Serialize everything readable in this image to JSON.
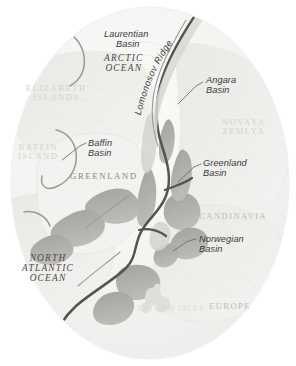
{
  "map": {
    "title": "Arctic Ocean and North Atlantic bathymetric basins map",
    "projection_shape": "oval",
    "colors": {
      "background": "#ffffff",
      "ocean_fill": "#f4f4f2",
      "shelf_fill": "#ededea",
      "ridge_dark": "#55554f",
      "ridge_mid": "#a9a8a3",
      "ridge_light": "#c8c7c2",
      "leader_line": "#6a6a66",
      "land_label_dark": "#8d8778",
      "land_label_faint": "#d3d2cf"
    },
    "features": [
      {
        "id": "laurentian-basin",
        "name": "Laurentian",
        "name_line2": "Basin",
        "type": "basin",
        "style": "feature",
        "x": 104,
        "y": 30,
        "leader": false
      },
      {
        "id": "arctic-ocean",
        "name": "ARCTIC",
        "name_line2": "OCEAN",
        "type": "ocean",
        "style": "ocean",
        "x": 113,
        "y": 55,
        "leader": false
      },
      {
        "id": "lomonosov-ridge",
        "name": "Lomonosov Ridge",
        "name_line2": "",
        "type": "ridge",
        "style": "feature-curved",
        "x": 151,
        "y": 40,
        "leader": false
      },
      {
        "id": "angara-basin",
        "name": "Angara",
        "name_line2": "Basin",
        "type": "basin",
        "style": "feature",
        "x": 206,
        "y": 77,
        "leader": true
      },
      {
        "id": "elizabeth-islands",
        "name": "ELIZABETH",
        "name_line2": "ISLANDS",
        "type": "land",
        "style": "land-faint",
        "x": 34,
        "y": 85,
        "leader": false
      },
      {
        "id": "novaya-zemlya",
        "name": "NOVAYA",
        "name_line2": "ZEMLYA",
        "type": "land",
        "style": "land-faint",
        "x": 228,
        "y": 120,
        "leader": false
      },
      {
        "id": "baffin-island",
        "name": "BAFFIN",
        "name_line2": "ISLAND",
        "type": "land",
        "style": "land-faint",
        "x": 22,
        "y": 144,
        "leader": false
      },
      {
        "id": "baffin-basin",
        "name": "Baffin",
        "name_line2": "Basin",
        "type": "basin",
        "style": "feature",
        "x": 88,
        "y": 140,
        "leader": true
      },
      {
        "id": "greenland",
        "name": "GREENLAND",
        "name_line2": "",
        "type": "land",
        "style": "land-dark",
        "x": 73,
        "y": 173,
        "leader": false
      },
      {
        "id": "greenland-basin",
        "name": "Greenland",
        "name_line2": "Basin",
        "type": "basin",
        "style": "feature",
        "x": 203,
        "y": 160,
        "leader": true
      },
      {
        "id": "scandinavia",
        "name": "SCANDINAVIA",
        "name_line2": "",
        "type": "land",
        "style": "land-mid",
        "x": 196,
        "y": 213,
        "leader": false
      },
      {
        "id": "norwegian-basin",
        "name": "Norwegian",
        "name_line2": "Basin",
        "type": "basin",
        "style": "feature",
        "x": 199,
        "y": 236,
        "leader": true
      },
      {
        "id": "north-atlantic-ocean",
        "name": "NORTH",
        "name_line2": "ATLANTIC",
        "name_line3": "OCEAN",
        "type": "ocean",
        "style": "ocean",
        "x": 30,
        "y": 255,
        "leader": false
      },
      {
        "id": "british-isles",
        "name": "BRITISH ISLES",
        "name_line2": "",
        "type": "land",
        "style": "land-vfaint",
        "x": 145,
        "y": 308,
        "leader": false
      },
      {
        "id": "europe",
        "name": "EUROPE",
        "name_line2": "",
        "type": "land",
        "style": "land-mid",
        "x": 212,
        "y": 305,
        "leader": false
      }
    ],
    "labels": {
      "laurentian_basin_l1": "Laurentian",
      "laurentian_basin_l2": "Basin",
      "arctic_ocean_l1": "ARCTIC",
      "arctic_ocean_l2": "OCEAN",
      "lomonosov_ridge": "Lomonosov Ridge",
      "angara_basin_l1": "Angara",
      "angara_basin_l2": "Basin",
      "elizabeth_islands_l1": "ELIZABETH",
      "elizabeth_islands_l2": "ISLANDS",
      "novaya_zemlya_l1": "NOVAYA",
      "novaya_zemlya_l2": "ZEMLYA",
      "baffin_island_l1": "BAFFIN",
      "baffin_island_l2": "ISLAND",
      "baffin_basin_l1": "Baffin",
      "baffin_basin_l2": "Basin",
      "greenland": "GREENLAND",
      "greenland_basin_l1": "Greenland",
      "greenland_basin_l2": "Basin",
      "scandinavia": "SCANDINAVIA",
      "norwegian_basin_l1": "Norwegian",
      "norwegian_basin_l2": "Basin",
      "north_atlantic_l1": "NORTH",
      "north_atlantic_l2": "ATLANTIC",
      "north_atlantic_l3": "OCEAN",
      "british_isles": "BRITISH ISLES",
      "europe": "EUROPE"
    }
  }
}
